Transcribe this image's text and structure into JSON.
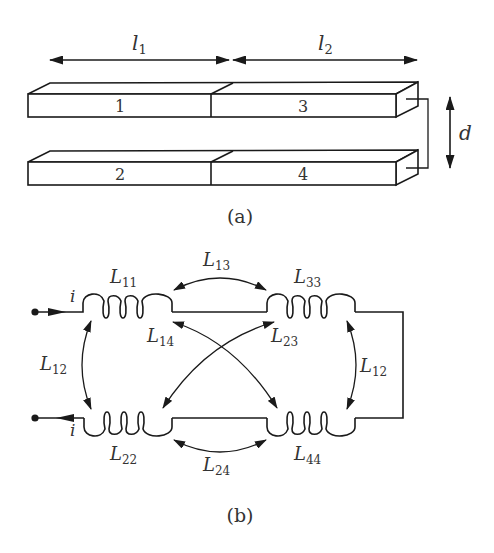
{
  "figure_a": {
    "caption": "(a)",
    "dimensions": {
      "l1": {
        "symbol": "l",
        "subscript": "1"
      },
      "l2": {
        "symbol": "l",
        "subscript": "2"
      },
      "d": {
        "symbol": "d"
      }
    },
    "segments": [
      {
        "id": "1",
        "label": "1"
      },
      {
        "id": "3",
        "label": "3"
      },
      {
        "id": "2",
        "label": "2"
      },
      {
        "id": "4",
        "label": "4"
      }
    ]
  },
  "figure_b": {
    "caption": "(b)",
    "current": {
      "symbol": "i"
    },
    "inductors": [
      {
        "id": "L11",
        "symbol": "L",
        "subscript": "11"
      },
      {
        "id": "L33",
        "symbol": "L",
        "subscript": "33"
      },
      {
        "id": "L22",
        "symbol": "L",
        "subscript": "22"
      },
      {
        "id": "L44",
        "symbol": "L",
        "subscript": "44"
      }
    ],
    "mutual": [
      {
        "id": "L13",
        "symbol": "L",
        "subscript": "13"
      },
      {
        "id": "L14",
        "symbol": "L",
        "subscript": "14"
      },
      {
        "id": "L23",
        "symbol": "L",
        "subscript": "23"
      },
      {
        "id": "L24",
        "symbol": "L",
        "subscript": "24"
      },
      {
        "id": "L12_left",
        "symbol": "L",
        "subscript": "12"
      },
      {
        "id": "L12_right",
        "symbol": "L",
        "subscript": "12"
      }
    ]
  },
  "colors": {
    "ink": "#1a1a1a",
    "text": "#333333",
    "background": "#ffffff"
  }
}
